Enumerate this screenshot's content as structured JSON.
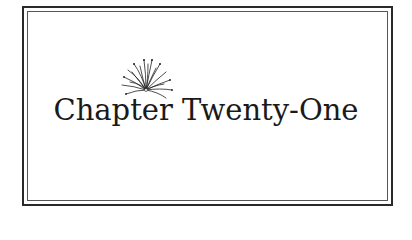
{
  "chapter": {
    "title": "Chapter Twenty-One",
    "ornament_icon": "firework-burst-icon"
  },
  "colors": {
    "text": "#1a1a1a",
    "border": "#2a2a2a",
    "background": "#ffffff"
  }
}
